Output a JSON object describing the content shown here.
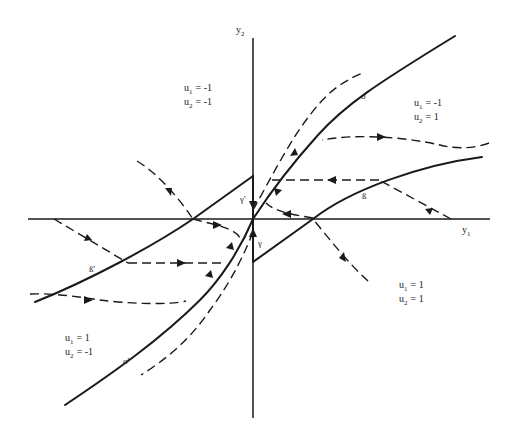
{
  "diagram": {
    "axes": {
      "horizontal": {
        "name": "y",
        "subscript": "1"
      },
      "vertical": {
        "name": "y",
        "subscript": "2"
      }
    },
    "regions": [
      {
        "id": "upper-left",
        "lines": [
          {
            "var": "u",
            "sub": "1",
            "eq": "= -1"
          },
          {
            "var": "u",
            "sub": "2",
            "eq": "= -1"
          }
        ]
      },
      {
        "id": "upper-right",
        "lines": [
          {
            "var": "u",
            "sub": "1",
            "eq": "= -1"
          },
          {
            "var": "u",
            "sub": "2",
            "eq": "=  1"
          }
        ]
      },
      {
        "id": "lower-right",
        "lines": [
          {
            "var": "u",
            "sub": "1",
            "eq": "= 1"
          },
          {
            "var": "u",
            "sub": "2",
            "eq": "= 1"
          }
        ]
      },
      {
        "id": "lower-left",
        "lines": [
          {
            "var": "u",
            "sub": "1",
            "eq": "= 1"
          },
          {
            "var": "u",
            "sub": "2",
            "eq": "= -1"
          }
        ]
      }
    ],
    "curve_labels": {
      "sigma": "σ",
      "sigma_prime": "σ'",
      "beta": "ß",
      "beta_prime": "ß'",
      "gamma": "γ",
      "gamma_prime": "γ'"
    }
  }
}
